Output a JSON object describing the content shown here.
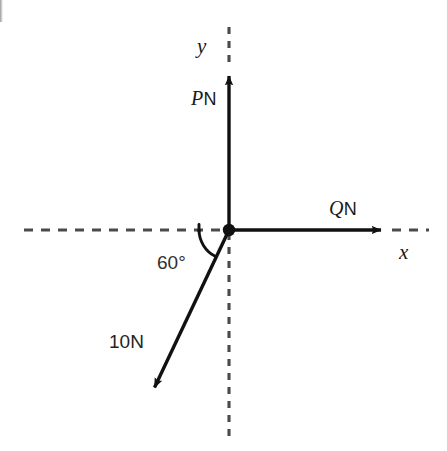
{
  "figure": {
    "kind": "force-vector-diagram",
    "background_color": "#ffffff",
    "stroke_color": "#111111",
    "dashed_color": "#4a4a4a"
  },
  "axes": {
    "origin": {
      "x": 229,
      "y": 230
    },
    "y_axis": {
      "label": "y",
      "arrow_tip": {
        "x": 229,
        "y": 67
      },
      "dashed_extension_top": {
        "x": 229,
        "y": 27
      },
      "dashed_extension_bottom": {
        "x": 229,
        "y": 438
      }
    },
    "x_axis": {
      "label": "x",
      "arrow_tip": {
        "x": 390,
        "y": 230
      },
      "dashed_extension_right": {
        "x": 429,
        "y": 230
      },
      "dashed_extension_left": {
        "x": 24,
        "y": 230
      }
    }
  },
  "vectors": [
    {
      "name": "P-force",
      "symbol": "P",
      "unit": "N",
      "label": "PN",
      "direction": "up along positive y-axis",
      "tip": {
        "x": 229,
        "y": 67
      }
    },
    {
      "name": "Q-force",
      "symbol": "Q",
      "unit": "N",
      "label": "QN",
      "direction": "right along positive x-axis",
      "tip": {
        "x": 390,
        "y": 230
      }
    },
    {
      "name": "known-force",
      "symbol": "10",
      "unit": "N",
      "label": "10N",
      "direction": "down and to the left, third quadrant",
      "tip": {
        "x": 150,
        "y": 397
      }
    }
  ],
  "angle": {
    "label": "60°",
    "value": 60,
    "unit": "degrees",
    "measured_from": "negative x-axis",
    "measured_to": "10N force vector",
    "arc_radius": 30
  }
}
